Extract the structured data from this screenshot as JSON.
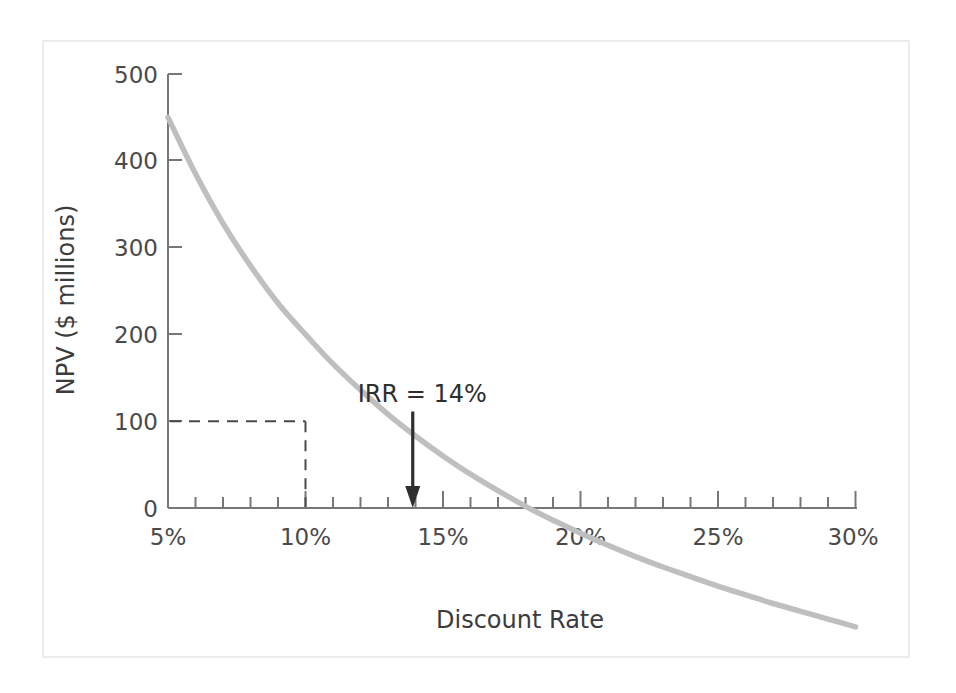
{
  "figure": {
    "background": "#ffffff",
    "frame_color": "#ececed"
  },
  "chart_data": {
    "type": "line",
    "title": "",
    "xlabel": "Discount Rate",
    "ylabel": "NPV ($ millions)",
    "xlim": [
      5,
      30
    ],
    "ylim": [
      -140,
      500
    ],
    "grid": false,
    "legend": null,
    "series": [
      {
        "name": "NPV profile",
        "color": "#bfbfbf",
        "x": [
          5,
          6,
          7,
          8,
          9,
          10,
          11,
          12,
          13,
          14,
          15,
          16,
          17,
          18,
          19,
          20,
          21,
          22,
          23,
          24,
          25,
          26,
          27,
          28,
          29,
          30
        ],
        "values": [
          450,
          385,
          328,
          279,
          236,
          200,
          166,
          136,
          108,
          83,
          60,
          39,
          20,
          2,
          -14,
          -29,
          -43,
          -56,
          -68,
          -79,
          -90,
          -100,
          -110,
          -119,
          -128,
          -137
        ]
      }
    ],
    "x_ticks_major": [
      5,
      10,
      15,
      20,
      25,
      30
    ],
    "x_tick_labels": [
      "5%",
      "10%",
      "15%",
      "20%",
      "25%",
      "30%"
    ],
    "x_ticks_minor_step": 1,
    "y_ticks_major": [
      0,
      100,
      200,
      300,
      400,
      500
    ],
    "y_tick_labels": [
      "0",
      "100",
      "200",
      "300",
      "400",
      "500"
    ],
    "annotations": [
      {
        "name": "irr-label",
        "text": "IRR = 14%",
        "x": 14,
        "y": 125,
        "arrow_to_x": 13.9,
        "arrow_to_y": 0,
        "color": "#2e2e2e"
      },
      {
        "name": "npv-at-10-percent-guide",
        "type": "dashed-guide",
        "x": 10,
        "y": 100,
        "color": "#4a4a4a"
      }
    ]
  }
}
